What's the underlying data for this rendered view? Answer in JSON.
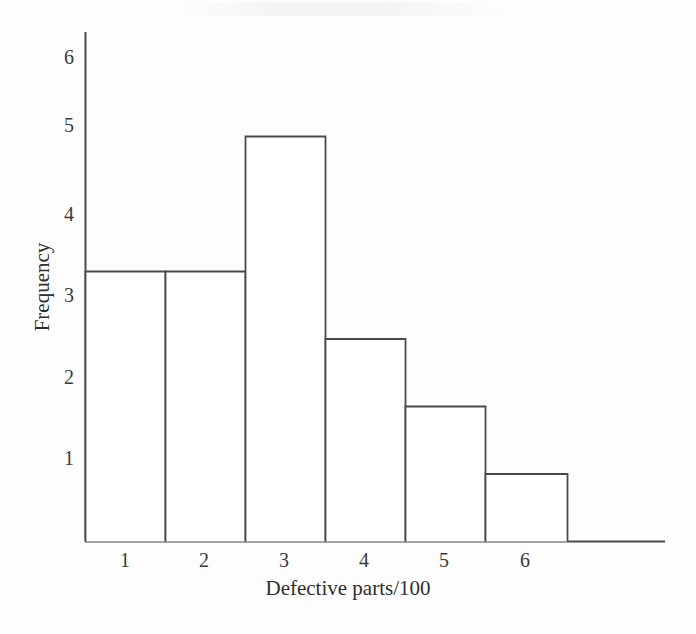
{
  "chart_data": {
    "type": "bar",
    "title": "",
    "subtitle": "",
    "xlabel": "Defective parts/100",
    "ylabel": "Frequency",
    "categories": [
      "1",
      "2",
      "3",
      "4",
      "5",
      "6"
    ],
    "values": [
      4,
      4,
      6,
      3,
      2,
      1
    ],
    "series": [
      {
        "name": "Frequency",
        "values": [
          4,
          4,
          6,
          3,
          2,
          1
        ]
      }
    ],
    "xtick_labels": [
      "1",
      "2",
      "3",
      "4",
      "5",
      "6"
    ],
    "ytick_labels": [
      "1",
      "2",
      "3",
      "4",
      "5",
      "6"
    ],
    "ylim": [
      0,
      6.5
    ],
    "xlim": [
      0.5,
      6.5
    ],
    "grid": false,
    "legend": false,
    "legend_position": "none",
    "bar_style": "histogram-adjacent-outline",
    "colors": {
      "line": "#4a4a4a",
      "bar_fill": "#ffffff",
      "text": "#333333",
      "background": "#fdfdfd"
    },
    "annotations": []
  },
  "axes": {
    "y_axis_name": "frequency-axis",
    "x_axis_name": "defective-parts-axis"
  }
}
